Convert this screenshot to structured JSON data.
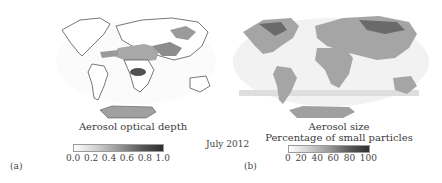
{
  "figure": {
    "date": "July 2012",
    "panels": [
      {
        "label": "(a)",
        "title": "Aerosol optical depth",
        "colorbar": {
          "ticks": [
            "0.0",
            "0.2",
            "0.4",
            "0.6",
            "0.8",
            "1.0"
          ],
          "range": [
            0.0,
            1.0
          ],
          "colors": [
            "#ffffff",
            "#3a3a3a"
          ]
        },
        "map_tones": {
          "land_base": "#ffffff",
          "high_aerosol": "#7a7a7a",
          "dust": "#a8a8a8",
          "antarctica": "#a0a0a0"
        }
      },
      {
        "label": "(b)",
        "title_line1": "Aerosol size",
        "title_line2": "Percentage of small particles",
        "colorbar": {
          "ticks": [
            "0",
            "20",
            "40",
            "60",
            "80",
            "100"
          ],
          "range": [
            0,
            100
          ],
          "colors": [
            "#ffffff",
            "#3a3a3a"
          ]
        },
        "map_tones": {
          "land_base": "#a5a5a5",
          "dense": "#6a6a6a",
          "ocean_speckle": "#dedede",
          "antarctica": "#a0a0a0"
        }
      }
    ]
  }
}
